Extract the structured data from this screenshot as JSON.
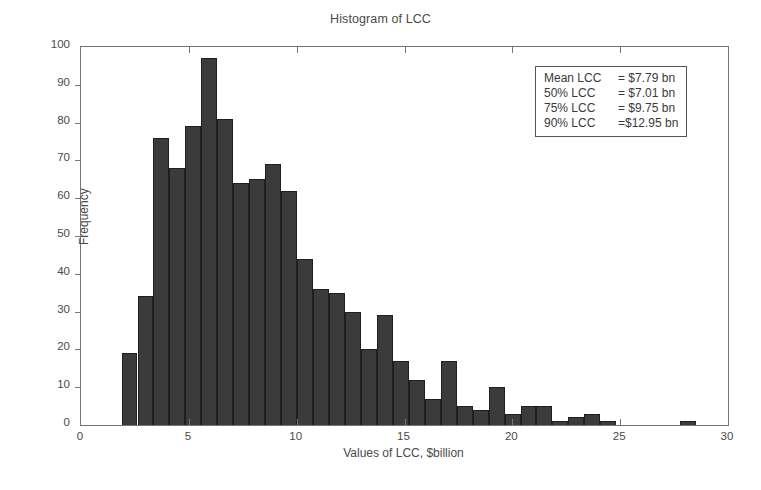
{
  "chart_data": {
    "type": "bar",
    "title": "Histogram of LCC",
    "xlabel": "Values of LCC, $billion",
    "ylabel": "Frequency",
    "xlim": [
      0,
      30
    ],
    "ylim": [
      0,
      100
    ],
    "xticks": [
      0,
      5,
      10,
      15,
      20,
      25,
      30
    ],
    "yticks": [
      0,
      10,
      20,
      30,
      40,
      50,
      60,
      70,
      80,
      90,
      100
    ],
    "grid": false,
    "legend": "none",
    "bin_width": 0.74,
    "bar_color": "#3b3b3b",
    "bin_centers": [
      2.25,
      2.99,
      3.73,
      4.47,
      5.21,
      5.95,
      6.69,
      7.43,
      8.17,
      8.91,
      9.65,
      10.39,
      11.13,
      11.87,
      12.61,
      13.35,
      14.09,
      14.83,
      15.57,
      16.31,
      17.05,
      17.79,
      18.53,
      19.27,
      20.01,
      20.75,
      21.49,
      22.23,
      22.97,
      23.71,
      24.45,
      25.19,
      25.93,
      26.67,
      27.41,
      28.15,
      28.89
    ],
    "values": [
      19,
      34,
      76,
      68,
      79,
      97,
      81,
      64,
      65,
      69,
      62,
      44,
      36,
      35,
      30,
      20,
      29,
      17,
      12,
      7,
      17,
      5,
      4,
      10,
      3,
      5,
      5,
      1,
      2,
      3,
      1,
      0,
      0,
      0,
      0,
      1,
      0
    ],
    "categories": [
      "2.25",
      "2.99",
      "3.73",
      "4.47",
      "5.21",
      "5.95",
      "6.69",
      "7.43",
      "8.17",
      "8.91",
      "9.65",
      "10.39",
      "11.13",
      "11.87",
      "12.61",
      "13.35",
      "14.09",
      "14.83",
      "15.57",
      "16.31",
      "17.05",
      "17.79",
      "18.53",
      "19.27",
      "20.01",
      "20.75",
      "21.49",
      "22.23",
      "22.97",
      "23.71",
      "24.45",
      "25.19",
      "25.93",
      "26.67",
      "27.41",
      "28.15",
      "28.89"
    ],
    "annotations": {
      "stats_box": {
        "rows": [
          {
            "key": "Mean LCC",
            "value": "= $7.79 bn"
          },
          {
            "key": "50% LCC",
            "value": "= $7.01 bn"
          },
          {
            "key": "75% LCC",
            "value": "= $9.75 bn"
          },
          {
            "key": "90% LCC",
            "value": "=$12.95 bn"
          }
        ]
      }
    }
  }
}
